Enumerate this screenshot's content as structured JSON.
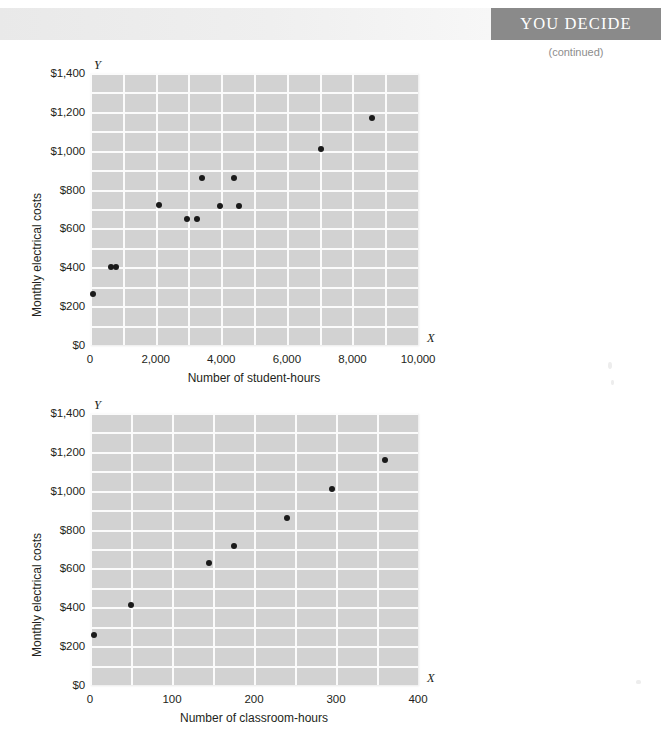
{
  "header": {
    "title": "YOU DECIDE",
    "continued_label": "(continued)",
    "band_color": "#8a8a8a",
    "title_color": "#ffffff"
  },
  "style": {
    "plot_background": "#d2d2d2",
    "gridline_color": "#fbfbfb",
    "point_color": "#1a1a1a",
    "text_color": "#231f20"
  },
  "chart_data": [
    {
      "type": "scatter",
      "id": "student-hours-scatter",
      "title": "",
      "xlabel": "Number of student-hours",
      "ylabel": "Monthly electrical costs",
      "x_axis_letter": "X",
      "y_axis_letter": "Y",
      "xlim": [
        0,
        10000
      ],
      "ylim": [
        0,
        1400
      ],
      "xticks": [
        0,
        2000,
        4000,
        6000,
        8000,
        10000
      ],
      "xtick_labels": [
        "0",
        "2,000",
        "4,000",
        "6,000",
        "8,000",
        "10,000"
      ],
      "yticks": [
        0,
        200,
        400,
        600,
        800,
        1000,
        1200,
        1400
      ],
      "ytick_labels": [
        "$0",
        "$200",
        "$400",
        "$600",
        "$800",
        "$1,000",
        "$1,200",
        "$1,400"
      ],
      "grid": true,
      "grid_x_step": 1000,
      "grid_y_step": 100,
      "legend": "none",
      "points": [
        {
          "x": 100,
          "y": 260
        },
        {
          "x": 650,
          "y": 400
        },
        {
          "x": 800,
          "y": 400
        },
        {
          "x": 2100,
          "y": 720
        },
        {
          "x": 2950,
          "y": 650
        },
        {
          "x": 3250,
          "y": 650
        },
        {
          "x": 3400,
          "y": 860
        },
        {
          "x": 3950,
          "y": 715
        },
        {
          "x": 4400,
          "y": 860
        },
        {
          "x": 4550,
          "y": 715
        },
        {
          "x": 7050,
          "y": 1010
        },
        {
          "x": 8600,
          "y": 1170
        }
      ]
    },
    {
      "type": "scatter",
      "id": "classroom-hours-scatter",
      "title": "",
      "xlabel": "Number of classroom-hours",
      "ylabel": "Monthly electrical costs",
      "x_axis_letter": "X",
      "y_axis_letter": "Y",
      "xlim": [
        0,
        400
      ],
      "ylim": [
        0,
        1400
      ],
      "xticks": [
        0,
        100,
        200,
        300,
        400
      ],
      "xtick_labels": [
        "0",
        "100",
        "200",
        "300",
        "400"
      ],
      "yticks": [
        0,
        200,
        400,
        600,
        800,
        1000,
        1200,
        1400
      ],
      "ytick_labels": [
        "$0",
        "$200",
        "$400",
        "$600",
        "$800",
        "$1,000",
        "$1,200",
        "$1,400"
      ],
      "grid": true,
      "grid_x_step": 50,
      "grid_y_step": 100,
      "legend": "none",
      "points": [
        {
          "x": 5,
          "y": 255
        },
        {
          "x": 50,
          "y": 410
        },
        {
          "x": 145,
          "y": 630
        },
        {
          "x": 175,
          "y": 715
        },
        {
          "x": 240,
          "y": 860
        },
        {
          "x": 295,
          "y": 1010
        },
        {
          "x": 360,
          "y": 1160
        }
      ]
    }
  ]
}
